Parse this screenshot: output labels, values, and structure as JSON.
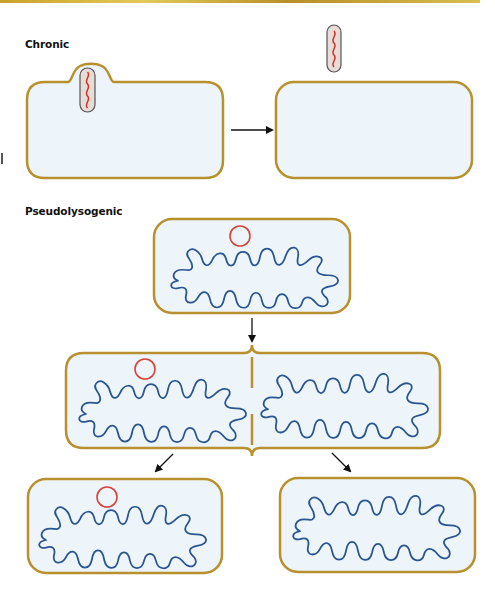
{
  "colors": {
    "cell_wall": "#b8902e",
    "cell_fill": "#eef5fa",
    "chromosome": "#2a5591",
    "plasmid_phage": "#d8433a",
    "phage_capsule_fill": "#e9dcd6",
    "phage_capsule_stroke": "#555555",
    "phage_dna": "#c8342c",
    "arrow": "#111111",
    "top_strip": "#d4b23c"
  },
  "sections": {
    "chronic": {
      "label": "Chronic",
      "steps": [
        {
          "name": "infected-cell-extruding-phage",
          "has_phage": true
        },
        {
          "name": "cell-after-phage-release",
          "released_phage": true
        }
      ]
    },
    "pseudolysogenic": {
      "label": "Pseudolysogenic",
      "steps": [
        {
          "name": "cell-with-phage-genome",
          "has_circle": true
        },
        {
          "name": "dividing-cell",
          "left_has_circle": true,
          "right_has_circle": false
        },
        {
          "name": "daughter-cell-with-phage",
          "has_circle": true
        },
        {
          "name": "daughter-cell-without-phage",
          "has_circle": false
        }
      ]
    }
  },
  "icons": {
    "phage": "phage-capsule-icon",
    "phage_genome": "circular-dna-icon",
    "chromosome": "bacterial-chromosome-icon",
    "arrow": "arrow-icon"
  }
}
